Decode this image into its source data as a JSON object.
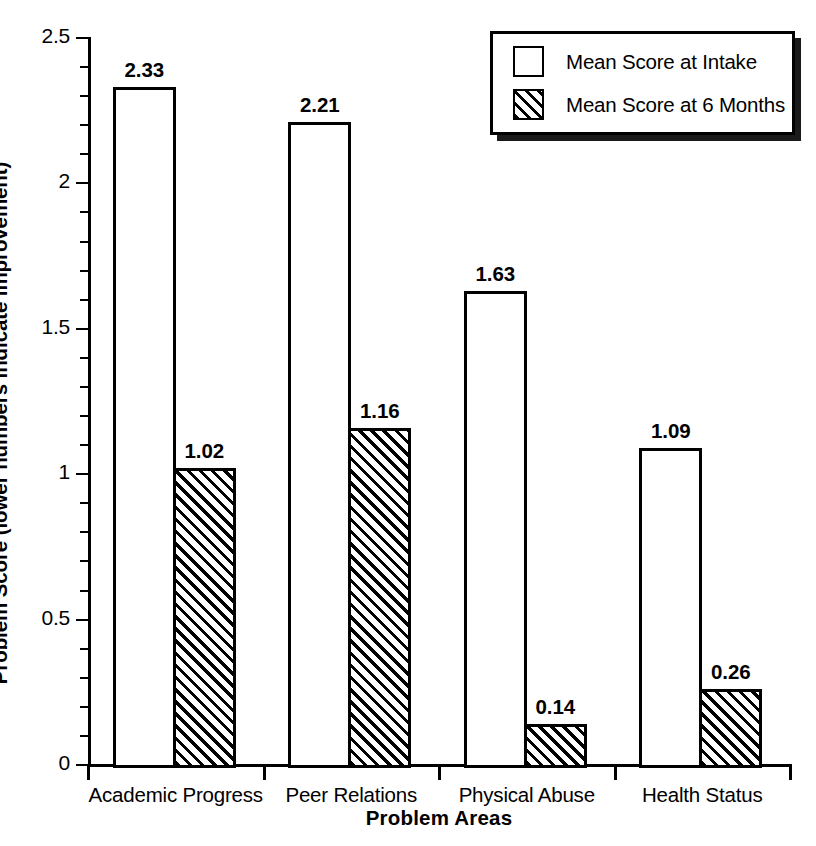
{
  "chart_data": {
    "type": "bar",
    "title": "",
    "xlabel": "Problem Areas",
    "ylabel": "Problem Score (lower numbers indicate improvement)",
    "categories": [
      "Academic Progress",
      "Peer Relations",
      "Physical Abuse",
      "Health Status"
    ],
    "series": [
      {
        "name": "Mean Score at Intake",
        "style": "open",
        "values": [
          2.33,
          2.21,
          1.63,
          1.09
        ],
        "labels": [
          "2.33",
          "2.21",
          "1.63",
          "1.09"
        ]
      },
      {
        "name": "Mean Score at 6 Months",
        "style": "hatched",
        "values": [
          1.02,
          1.16,
          0.14,
          0.26
        ],
        "labels": [
          "1.02",
          "1.16",
          "0.14",
          "0.26"
        ]
      }
    ],
    "ylim": [
      0,
      2.5
    ],
    "ytick_major_values": [
      0,
      0.5,
      1,
      1.5,
      2,
      2.5
    ],
    "ytick_major_labels": [
      "0",
      "0.5",
      "1",
      "1.5",
      "2",
      "2.5"
    ],
    "ytick_minor_step": 0.1,
    "grid": false,
    "legend_position": "top-right",
    "legend_entries": [
      "Mean Score at Intake",
      "Mean Score at 6 Months"
    ],
    "colors": {
      "ink": "#000000",
      "background": "#ffffff",
      "legend_shadow": "#1a1a1a"
    }
  }
}
